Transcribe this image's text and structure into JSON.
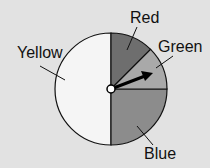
{
  "diagram": {
    "type": "spinner",
    "sections": [
      {
        "label": "Red",
        "fraction": 0.125,
        "color": "#6e6e6e"
      },
      {
        "label": "Green",
        "fraction": 0.125,
        "color": "#a9a9a9"
      },
      {
        "label": "Blue",
        "fraction": 0.25,
        "color": "#8c8c8c"
      },
      {
        "label": "Yellow",
        "fraction": 0.5,
        "color": "#f5f5f5"
      }
    ],
    "arrow": "pointer-icon"
  },
  "labels": {
    "red": "Red",
    "green": "Green",
    "blue": "Blue",
    "yellow": "Yellow"
  }
}
